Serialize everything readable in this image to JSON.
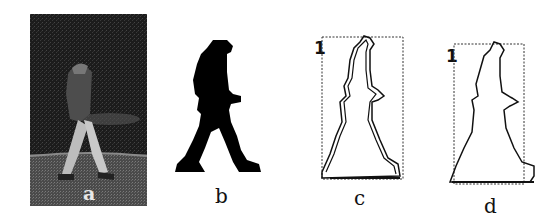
{
  "figure": {
    "panels": [
      {
        "id": "a",
        "label": "a",
        "description": "grayscale photo of walking person"
      },
      {
        "id": "b",
        "label": "b",
        "description": "binary silhouette"
      },
      {
        "id": "c",
        "label": "c",
        "description": "contour with bounding box",
        "marker": "1"
      },
      {
        "id": "d",
        "label": "d",
        "description": "contour with bounding box",
        "marker": "1"
      }
    ],
    "colors": {
      "ink": "#111111",
      "photo_bg": "#1a1a1a",
      "background": "#ffffff"
    }
  }
}
